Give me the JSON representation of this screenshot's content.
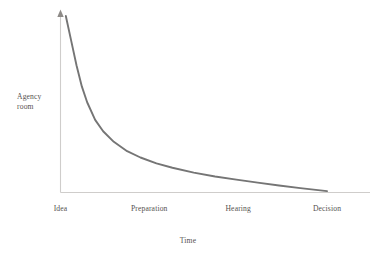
{
  "chart_data": {
    "type": "line",
    "title": "",
    "subtitle": "",
    "xlabel": "Time",
    "ylabel": "Agency\nroom",
    "ylabel_lines": [
      "Agency",
      "room"
    ],
    "categories": [
      "Idea",
      "Preparation",
      "Hearing",
      "Decision"
    ],
    "x_tick_positions": [
      0.0,
      0.333,
      0.667,
      1.0
    ],
    "series": [
      {
        "name": "Agency room",
        "description": "Agency room decays steeply from its maximum at the idea stage and flattens to near zero by the decision stage",
        "x": [
          0.02,
          0.04,
          0.06,
          0.08,
          0.1,
          0.13,
          0.16,
          0.2,
          0.25,
          0.3,
          0.36,
          0.42,
          0.5,
          0.58,
          0.66,
          0.74,
          0.82,
          0.9,
          1.0
        ],
        "values": [
          1.0,
          0.86,
          0.72,
          0.6,
          0.51,
          0.41,
          0.345,
          0.285,
          0.232,
          0.196,
          0.163,
          0.138,
          0.11,
          0.088,
          0.07,
          0.053,
          0.037,
          0.022,
          0.005
        ]
      }
    ],
    "xlim": [
      0,
      1.08
    ],
    "ylim": [
      0,
      1.05
    ],
    "grid": false,
    "legend": false,
    "legend_position": "none",
    "annotations": [],
    "y_axis_arrow": true,
    "x_axis_ticks_visible": false,
    "y_axis_ticks_visible": false
  },
  "style": {
    "curve_color": "#757575",
    "axis_color": "#cfcdcb",
    "text_color": "#55524f",
    "background_color": "#ffffff",
    "curve_width": 1.9
  }
}
